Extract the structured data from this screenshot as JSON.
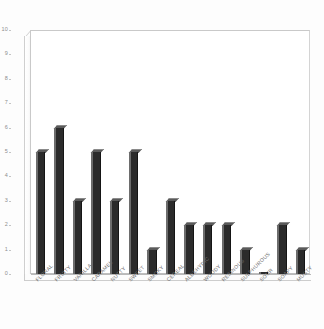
{
  "chart_data": {
    "type": "bar",
    "title": "",
    "subtitle": "",
    "xlabel": "",
    "ylabel": "",
    "ylim": [
      0,
      10
    ],
    "yticks": [
      0,
      1,
      2,
      3,
      4,
      5,
      6,
      7,
      8,
      9,
      10
    ],
    "ytick_labels": [
      "0",
      "1",
      "2",
      "3",
      "4",
      "5",
      "6",
      "7",
      "8",
      "9",
      "10"
    ],
    "grid": false,
    "legend": null,
    "style": "3d-column",
    "bar_color": "#2b2b2b",
    "bar_highlight_color": "#6d6d6d",
    "frame_color": "#c9c9c9",
    "background_color": "#ffffff",
    "tick_label_color": "#8d8d8d",
    "category_label_color": "#6f6f6f",
    "category_label_rotation": -45,
    "categories": [
      "FLORAL",
      "FRUITY",
      "VANILLA",
      "CARAMEL",
      "NUTTY",
      "SWEET",
      "SMOKY",
      "CEREAL",
      "ALDEHYDIC",
      "WOODY",
      "RESINOUS",
      "SULPHUROUS",
      "SOUR",
      "SOAPY",
      "MUSTY"
    ],
    "values": [
      5,
      6,
      3,
      5,
      3,
      5,
      1,
      3,
      2,
      2,
      2,
      1,
      0,
      2,
      1
    ]
  }
}
